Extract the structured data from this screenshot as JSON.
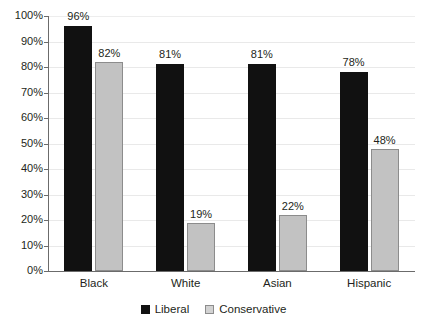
{
  "chart_data": {
    "type": "bar",
    "title": "",
    "subtitle": "",
    "xlabel": "",
    "ylabel": "",
    "categories": [
      "Black",
      "White",
      "Asian",
      "Hispanic"
    ],
    "series": [
      {
        "name": "Liberal",
        "color": "#111111",
        "values": [
          96,
          81,
          81,
          78
        ],
        "labels": [
          "96%",
          "81%",
          "81%",
          "78%"
        ]
      },
      {
        "name": "Conservative",
        "color": "#c2c2c2",
        "values": [
          82,
          19,
          22,
          48
        ],
        "labels": [
          "82%",
          "19%",
          "22%",
          "48%"
        ]
      }
    ],
    "ylim": [
      0,
      100
    ],
    "ytick_values": [
      0,
      10,
      20,
      30,
      40,
      50,
      60,
      70,
      80,
      90,
      100
    ],
    "ytick_labels": [
      "0%",
      "10%",
      "20%",
      "30%",
      "40%",
      "50%",
      "60%",
      "70%",
      "80%",
      "90%",
      "100%"
    ],
    "grid": true,
    "grid_color": "#e9e9e9",
    "axis_color": "#6b6b6b",
    "legend_position": "bottom",
    "value_labels_shown": true,
    "background": "#ffffff"
  },
  "legend": {
    "items": [
      {
        "label": "Liberal",
        "swatch": "legend-swatch-liberal"
      },
      {
        "label": "Conservative",
        "swatch": "legend-swatch-conservative"
      }
    ]
  }
}
